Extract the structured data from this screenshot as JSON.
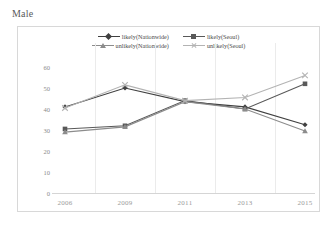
{
  "page_title": "Male",
  "chart_data": {
    "type": "line",
    "title": "Male",
    "xlabel": "",
    "ylabel": "",
    "categories": [
      "2006",
      "2009",
      "2011",
      "2013",
      "2015"
    ],
    "ytick_labels": [
      "0",
      "10",
      "20",
      "30",
      "40",
      "50",
      "60"
    ],
    "yticks": [
      0,
      10,
      20,
      30,
      40,
      50,
      60
    ],
    "ylim": [
      0,
      60
    ],
    "grid": "vertical",
    "legend_position": "top-center",
    "series": [
      {
        "name": "likely(Nationwide)",
        "marker": "diamond",
        "color": "#404040",
        "values": [
          41,
          50,
          43.5,
          41,
          32.5
        ]
      },
      {
        "name": "likely(Seoul)",
        "marker": "square",
        "color": "#595959",
        "values": [
          30.5,
          32,
          44,
          40,
          52
        ]
      },
      {
        "name": "unlikely(Nationwide)",
        "marker": "triangle",
        "color": "#8c8c8c",
        "values": [
          29,
          31.5,
          43.5,
          40,
          29.5
        ]
      },
      {
        "name": "unlikely(Seoul)",
        "marker": "cross",
        "color": "#b3b3b3",
        "values": [
          40.5,
          51.5,
          44,
          45.5,
          56
        ]
      }
    ]
  },
  "colors": {
    "frame": "#d8d8d8",
    "gridline": "#ebebeb",
    "axis": "#d5d5d5",
    "tick_text": "#8a8a8a",
    "legend_text": "#4a4a4a",
    "title_text": "#5a5a5a"
  }
}
